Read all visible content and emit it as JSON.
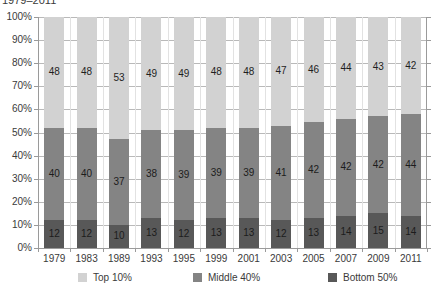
{
  "chart_data": {
    "type": "bar",
    "variant": "stacked-100-percent",
    "title": "1979–2011",
    "xlabel": "",
    "ylabel": "",
    "ylim": [
      0,
      100
    ],
    "ytick_labels": [
      "100%",
      "90%",
      "80%",
      "70%",
      "60%",
      "50%",
      "40%",
      "30%",
      "20%",
      "10%",
      "0%"
    ],
    "ytick_values": [
      100,
      90,
      80,
      70,
      60,
      50,
      40,
      30,
      20,
      10,
      0
    ],
    "grid": true,
    "legend_position": "bottom",
    "categories": [
      "1979",
      "1983",
      "1989",
      "1993",
      "1995",
      "1999",
      "2001",
      "2003",
      "2005",
      "2007",
      "2009",
      "2011"
    ],
    "series": [
      {
        "name": "Top 10%",
        "color": "#d2d2d2",
        "values": [
          48,
          48,
          53,
          49,
          49,
          48,
          48,
          47,
          46,
          44,
          43,
          42
        ]
      },
      {
        "name": "Middle 40%",
        "color": "#848484",
        "values": [
          40,
          40,
          37,
          38,
          39,
          39,
          39,
          41,
          42,
          42,
          42,
          44
        ]
      },
      {
        "name": "Bottom 50%",
        "color": "#585858",
        "values": [
          12,
          12,
          10,
          13,
          12,
          13,
          13,
          12,
          13,
          14,
          15,
          14
        ]
      }
    ]
  }
}
